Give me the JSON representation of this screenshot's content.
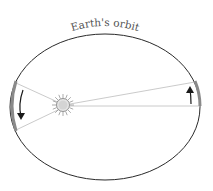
{
  "diagram": {
    "title_label": "Earth's orbit",
    "colors": {
      "orbit": "#2a2a2a",
      "swept_lines": "#bdbdbd",
      "arc_highlight": "#8a8a8a",
      "arrow": "#1a1a1a",
      "sun_fill": "#e6e6e6",
      "sun_outline": "#777777",
      "label": "#555555"
    },
    "elements": [
      {
        "name": "orbit-ellipse",
        "description": "Elliptical orbit of Earth"
      },
      {
        "name": "sun",
        "description": "Sun at one focus of the ellipse"
      },
      {
        "name": "left-sector",
        "description": "Wide swept sector near perihelion with downward motion arrow"
      },
      {
        "name": "right-sector",
        "description": "Narrow swept sector near aphelion with upward motion arrow"
      }
    ]
  }
}
